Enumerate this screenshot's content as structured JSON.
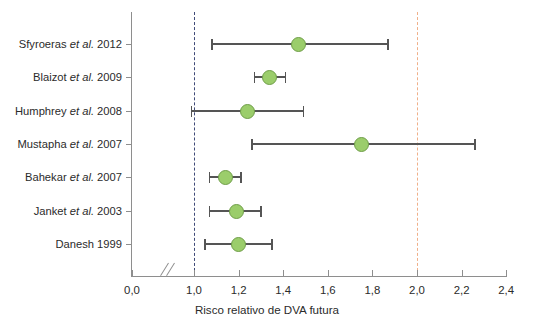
{
  "chart_data": {
    "type": "scatter",
    "subtype": "forest-plot",
    "title": "",
    "xlabel": "Risco relativo de DVA futura",
    "ylabel": "",
    "xlim": [
      0.94,
      2.46
    ],
    "xticks": [
      "0,0",
      "1,0",
      "1,2",
      "1,4",
      "1,6",
      "1,8",
      "2,0",
      "2,2",
      "2,4"
    ],
    "xtick_values": [
      0.0,
      1.0,
      1.2,
      1.4,
      1.6,
      1.8,
      2.0,
      2.2,
      2.4
    ],
    "axis_break": true,
    "grid": false,
    "legend": "none",
    "reference_lines": [
      {
        "name": "null-effect",
        "value": 1.0,
        "color": "#3f4a78",
        "style": "dashed"
      },
      {
        "name": "high-risk",
        "value": 2.0,
        "color": "#f0b08a",
        "style": "dashed"
      }
    ],
    "marker_color": "#9bcd6b",
    "marker_edge_color": "#6f9e48",
    "ci_color": "#555555",
    "categories": [
      "Sfyroeras et al. 2012",
      "Blaizot et al. 2009",
      "Humphrey et al. 2008",
      "Mustapha et al. 2007",
      "Bahekar et al. 2007",
      "Janket et al. 2003",
      "Danesh 1999"
    ],
    "values": [
      1.47,
      1.34,
      1.24,
      1.75,
      1.14,
      1.19,
      1.2
    ],
    "ci_low": [
      1.08,
      1.27,
      0.99,
      1.26,
      1.07,
      1.07,
      1.05
    ],
    "ci_high": [
      1.87,
      1.41,
      1.49,
      2.26,
      1.21,
      1.3,
      1.35
    ],
    "points": [
      {
        "study_prefix": "Sfyroeras",
        "study_emph": "et al.",
        "study_suffix": "2012",
        "rr": 1.47,
        "lo": 1.08,
        "hi": 1.87
      },
      {
        "study_prefix": "Blaizot",
        "study_emph": "et al.",
        "study_suffix": "2009",
        "rr": 1.34,
        "lo": 1.27,
        "hi": 1.41
      },
      {
        "study_prefix": "Humphrey",
        "study_emph": "et al.",
        "study_suffix": "2008",
        "rr": 1.24,
        "lo": 0.99,
        "hi": 1.49
      },
      {
        "study_prefix": "Mustapha",
        "study_emph": "et al.",
        "study_suffix": "2007",
        "rr": 1.75,
        "lo": 1.26,
        "hi": 2.26
      },
      {
        "study_prefix": "Bahekar",
        "study_emph": "et al.",
        "study_suffix": "2007",
        "rr": 1.14,
        "lo": 1.07,
        "hi": 1.21
      },
      {
        "study_prefix": "Janket",
        "study_emph": "et al.",
        "study_suffix": "2003",
        "rr": 1.19,
        "lo": 1.07,
        "hi": 1.3
      },
      {
        "study_prefix": "Danesh",
        "study_emph": "",
        "study_suffix": "1999",
        "rr": 1.2,
        "lo": 1.05,
        "hi": 1.35
      }
    ]
  },
  "axis": {
    "x_title": "Risco relativo de DVA futura",
    "tick_labels": [
      "0,0",
      "1,0",
      "1,2",
      "1,4",
      "1,6",
      "1,8",
      "2,0",
      "2,2",
      "2,4"
    ]
  }
}
